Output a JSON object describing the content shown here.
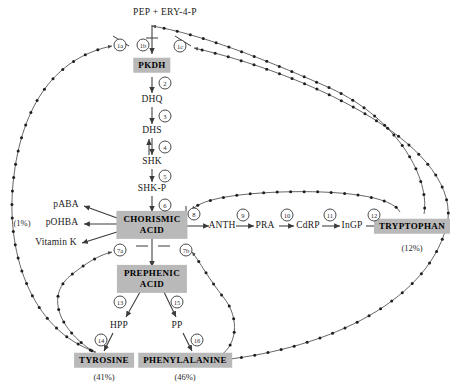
{
  "diagram": {
    "substrate": "PEP + ERY-4-P",
    "colors": {
      "box_fill": "#b9b9b9",
      "line": "#3a3a3a",
      "text": "#1a1a1a",
      "feedback_line": "#4a4a4a"
    },
    "metabolites": [
      {
        "id": "pkdh",
        "label": "PKDH",
        "x": 152,
        "y": 65,
        "kind": "endproduct"
      },
      {
        "id": "dhq",
        "label": "DHQ",
        "x": 152,
        "y": 100,
        "kind": "metabolite"
      },
      {
        "id": "dhs",
        "label": "DHS",
        "x": 152,
        "y": 131,
        "kind": "metabolite"
      },
      {
        "id": "shk",
        "label": "SHK",
        "x": 152,
        "y": 162,
        "kind": "metabolite"
      },
      {
        "id": "shkp",
        "label": "SHK-P",
        "x": 152,
        "y": 189,
        "kind": "metabolite"
      },
      {
        "id": "chor",
        "label": "CHORISMIC\nACID",
        "x": 152,
        "y": 225,
        "kind": "endproduct2"
      },
      {
        "id": "anth",
        "label": "ANTH",
        "x": 222,
        "y": 226,
        "kind": "metabolite"
      },
      {
        "id": "pra",
        "label": "PRA",
        "x": 265,
        "y": 226,
        "kind": "metabolite"
      },
      {
        "id": "cdrp",
        "label": "CdRP",
        "x": 308,
        "y": 226,
        "kind": "metabolite"
      },
      {
        "id": "ingp",
        "label": "InGP",
        "x": 352,
        "y": 226,
        "kind": "metabolite"
      },
      {
        "id": "trp",
        "label": "TRYPTOPHAN",
        "x": 412,
        "y": 226,
        "kind": "endproduct"
      },
      {
        "id": "paba",
        "label": "pABA",
        "x": 66,
        "y": 205,
        "kind": "metabolite"
      },
      {
        "id": "pohba",
        "label": "pOHBA",
        "x": 62,
        "y": 223,
        "kind": "metabolite"
      },
      {
        "id": "vitk",
        "label": "Vitamin K",
        "x": 56,
        "y": 243,
        "kind": "metabolite"
      },
      {
        "id": "preph",
        "label": "PREPHENIC\nACID",
        "x": 152,
        "y": 279,
        "kind": "endproduct2"
      },
      {
        "id": "hpp",
        "label": "HPP",
        "x": 119,
        "y": 326,
        "kind": "metabolite"
      },
      {
        "id": "pp",
        "label": "PP",
        "x": 177,
        "y": 326,
        "kind": "metabolite"
      },
      {
        "id": "tyr",
        "label": "TYROSINE",
        "x": 104,
        "y": 360,
        "kind": "endproduct"
      },
      {
        "id": "phe",
        "label": "PHENYLALANINE",
        "x": 185,
        "y": 360,
        "kind": "endproduct"
      }
    ],
    "yields": [
      {
        "id": "yield-pohba",
        "label": "(1%)",
        "x": 22,
        "y": 223
      },
      {
        "id": "yield-trp",
        "label": "(12%)",
        "x": 412,
        "y": 248
      },
      {
        "id": "yield-tyr",
        "label": "(41%)",
        "x": 104,
        "y": 377
      },
      {
        "id": "yield-phe",
        "label": "(46%)",
        "x": 185,
        "y": 377
      }
    ],
    "reactions": [
      {
        "id": "r1a",
        "label": "1a",
        "x": 120,
        "y": 45
      },
      {
        "id": "r1b",
        "label": "1b",
        "x": 143,
        "y": 45
      },
      {
        "id": "r1c",
        "label": "1c",
        "x": 180,
        "y": 46
      },
      {
        "id": "r2",
        "label": "2",
        "x": 165,
        "y": 83
      },
      {
        "id": "r3",
        "label": "3",
        "x": 165,
        "y": 116
      },
      {
        "id": "r4",
        "label": "4",
        "x": 165,
        "y": 147
      },
      {
        "id": "r5",
        "label": "5",
        "x": 165,
        "y": 176
      },
      {
        "id": "r6",
        "label": "6",
        "x": 165,
        "y": 205
      },
      {
        "id": "r7a",
        "label": "7a",
        "x": 120,
        "y": 250
      },
      {
        "id": "r7b",
        "label": "7b",
        "x": 186,
        "y": 250
      },
      {
        "id": "r8",
        "label": "8",
        "x": 194,
        "y": 214
      },
      {
        "id": "r9",
        "label": "9",
        "x": 243,
        "y": 215
      },
      {
        "id": "r10",
        "label": "10",
        "x": 287,
        "y": 215
      },
      {
        "id": "r11",
        "label": "11",
        "x": 330,
        "y": 215
      },
      {
        "id": "r12",
        "label": "12",
        "x": 374,
        "y": 215
      },
      {
        "id": "r13",
        "label": "13",
        "x": 120,
        "y": 302
      },
      {
        "id": "r15",
        "label": "15",
        "x": 177,
        "y": 302
      },
      {
        "id": "r14",
        "label": "14",
        "x": 101,
        "y": 340
      },
      {
        "id": "r16",
        "label": "16",
        "x": 197,
        "y": 340
      }
    ]
  }
}
